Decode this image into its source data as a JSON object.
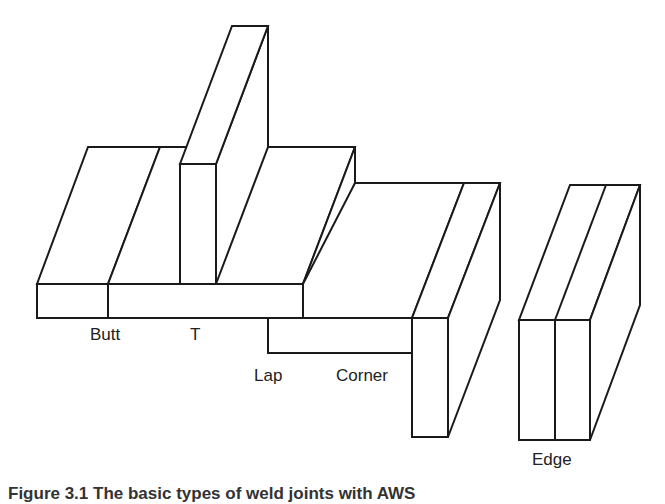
{
  "diagram": {
    "labels": {
      "butt": "Butt",
      "t": "T",
      "lap": "Lap",
      "corner": "Corner",
      "edge": "Edge"
    },
    "caption": "Figure 3.1  The basic types of weld joints with AWS"
  }
}
